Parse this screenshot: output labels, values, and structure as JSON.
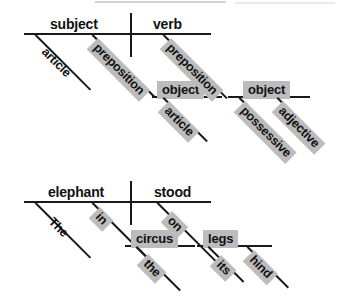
{
  "figure": {
    "ink_color": "#1a1a1a",
    "shade_color": "#bcbcbc",
    "background": "#ffffff"
  },
  "diagrams": [
    {
      "id": "roles-diagram",
      "name": "grammar-roles-diagram",
      "caption": "Abstract grammar-role template",
      "baseline": {
        "subject_label": "subject",
        "verb_label": "verb"
      },
      "modifiers": [
        {
          "text": "article",
          "shaded": false,
          "attaches_to": "subject"
        },
        {
          "text": "preposition",
          "shaded": true,
          "attaches_to": "subject"
        },
        {
          "text": "object",
          "shaded": true,
          "attaches_to": "preposition-1",
          "boxed": true
        },
        {
          "text": "article",
          "shaded": true,
          "attaches_to": "object-1"
        },
        {
          "text": "preposition",
          "shaded": true,
          "attaches_to": "verb"
        },
        {
          "text": "object",
          "shaded": true,
          "attaches_to": "preposition-2",
          "boxed": true
        },
        {
          "text": "possessive",
          "shaded": true,
          "attaches_to": "object-2"
        },
        {
          "text": "adjective",
          "shaded": true,
          "attaches_to": "object-2"
        }
      ]
    },
    {
      "id": "example-diagram",
      "name": "example-sentence-diagram",
      "caption": "The elephant stood in the circus on its hind legs",
      "baseline": {
        "subject_label": "elephant",
        "verb_label": "stood"
      },
      "modifiers": [
        {
          "text": "The",
          "shaded": false,
          "attaches_to": "elephant"
        },
        {
          "text": "in",
          "shaded": true,
          "attaches_to": "elephant"
        },
        {
          "text": "circus",
          "shaded": true,
          "attaches_to": "in",
          "boxed": true
        },
        {
          "text": "the",
          "shaded": true,
          "attaches_to": "circus"
        },
        {
          "text": "on",
          "shaded": true,
          "attaches_to": "stood"
        },
        {
          "text": "legs",
          "shaded": true,
          "attaches_to": "on",
          "boxed": true
        },
        {
          "text": "its",
          "shaded": true,
          "attaches_to": "legs"
        },
        {
          "text": "hind",
          "shaded": true,
          "attaches_to": "legs"
        }
      ]
    }
  ]
}
